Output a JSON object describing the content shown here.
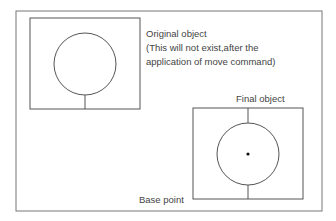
{
  "diagram": {
    "labels": {
      "original_title": "Original object",
      "original_note_1": "(This will not exist,after the",
      "original_note_2": "application of move command)",
      "final_title": "Final object",
      "base_point": "Base point"
    },
    "colors": {
      "line": "#555555",
      "text": "#444444",
      "background": "#ffffff"
    }
  }
}
